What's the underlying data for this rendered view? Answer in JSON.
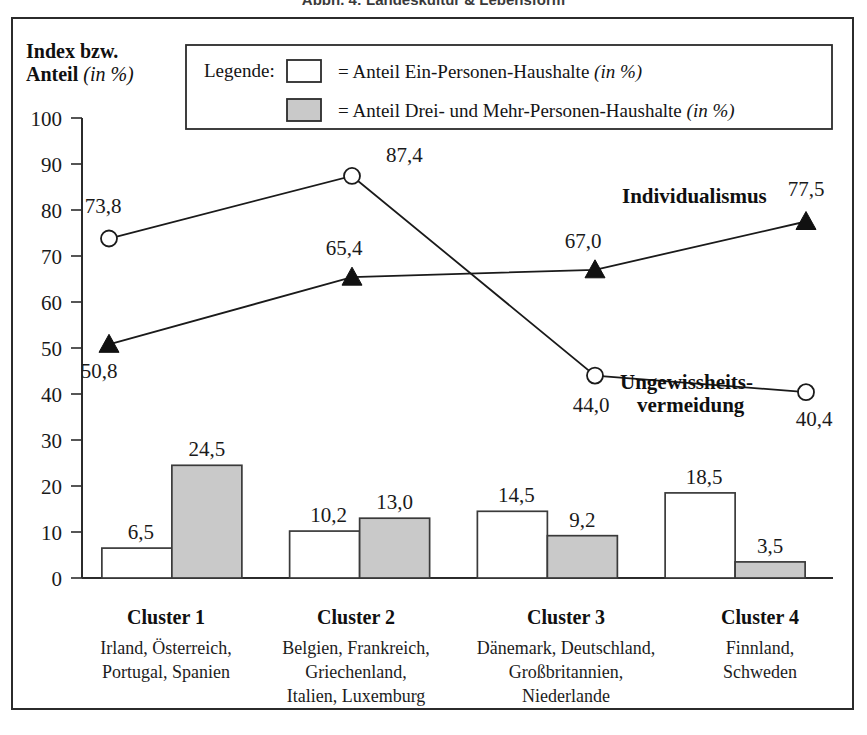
{
  "caption": {
    "text": "Abbn. 4: Landeskultur & Lebensform"
  },
  "axis": {
    "y_title_line1": "Index bzw.",
    "y_title_line2_bold": "Anteil ",
    "y_title_line2_italic": "(in %)",
    "y_ticks": [
      "100",
      "90",
      "80",
      "70",
      "60",
      "50",
      "40",
      "30",
      "20",
      "10",
      "0"
    ]
  },
  "legend": {
    "title": "Legende:",
    "entries": [
      {
        "swatch": "white-square",
        "text": "= Anteil Ein-Personen-Haushalte ",
        "italic": "(in %)"
      },
      {
        "swatch": "gray-square",
        "text": "= Anteil Drei- und Mehr-Personen-Haushalte ",
        "italic": "(in %)"
      }
    ]
  },
  "chart_data": {
    "type": "bar",
    "title": "Abbn. 4: Landeskultur & Lebensform",
    "xlabel": "",
    "ylabel": "Index bzw. Anteil (in %)",
    "ylim": [
      0,
      100
    ],
    "grid": false,
    "legend_position": "top",
    "categories": [
      "Cluster 1",
      "Cluster 2",
      "Cluster 3",
      "Cluster 4"
    ],
    "category_members": [
      "Irland, Österreich,\nPortugal, Spanien",
      "Belgien, Frankreich,\nGriechenland,\nItalien, Luxemburg",
      "Dänemark, Deutschland,\nGroßbritannien,\nNiederlande",
      "Finnland,\nSchweden"
    ],
    "bar_series": [
      {
        "name": "Anteil Ein-Personen-Haushalte (in %)",
        "style": "white",
        "values": [
          6.5,
          10.2,
          14.5,
          18.5
        ],
        "labels": [
          "6,5",
          "10,2",
          "14,5",
          "18,5"
        ]
      },
      {
        "name": "Anteil Drei- und Mehr-Personen-Haushalte (in %)",
        "style": "gray",
        "values": [
          24.5,
          13.0,
          9.2,
          3.5
        ],
        "labels": [
          "24,5",
          "13,0",
          "9,2",
          "3,5"
        ]
      }
    ],
    "line_series": [
      {
        "name": "Ungewissheitsvermeidung",
        "name_display_line1": "Ungewissheits-",
        "name_display_line2": "vermeidung",
        "marker": "open-circle",
        "values": [
          73.8,
          87.4,
          44.0,
          40.4
        ],
        "labels": [
          "73,8",
          "87,4",
          "44,0",
          "40,4"
        ]
      },
      {
        "name": "Individualismus",
        "name_display_line1": "Individualismus",
        "name_display_line2": "",
        "marker": "solid-triangle",
        "values": [
          50.8,
          65.4,
          67.0,
          77.5
        ],
        "labels": [
          "50,8",
          "65,4",
          "67,0",
          "77,5"
        ]
      }
    ]
  },
  "colors": {
    "bar_white_fill": "#ffffff",
    "bar_gray_fill": "#c9c9c9",
    "ink": "#1a1a1a",
    "frame": "#2b2b2b"
  }
}
